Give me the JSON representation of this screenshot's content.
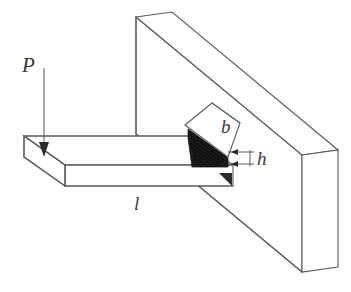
{
  "figure": {
    "type": "engineering-line-drawing",
    "background_color": "#ffffff",
    "line_color": "#5a5a5a",
    "section_fill_color": "#1a1a1a",
    "label_color": "#3a3a3a"
  },
  "labels": {
    "load": "P",
    "width": "b",
    "height": "h",
    "length": "l"
  },
  "annotations": {
    "load_label_meaning": "applied point load",
    "width_label_meaning": "cross-section width",
    "height_label_meaning": "cross-section height",
    "length_label_meaning": "beam length"
  },
  "parts": {
    "wall": "vertical support wall",
    "beam": "horizontal cantilever beam",
    "cross_section": "hatched beam cross-section at wall",
    "load_arrow": "downward force arrow at free end"
  }
}
